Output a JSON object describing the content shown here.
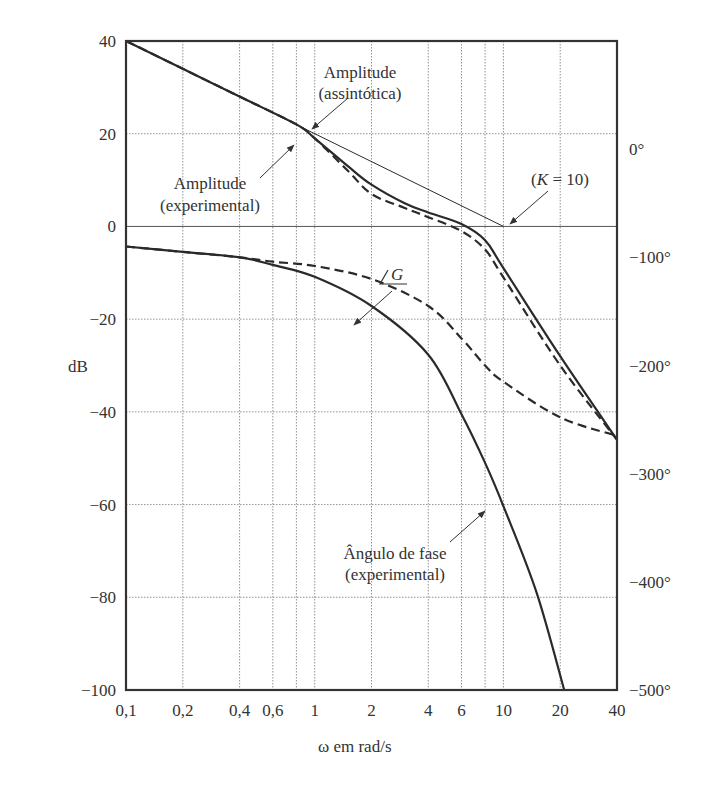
{
  "chart_data": {
    "type": "line",
    "title": "",
    "xlabel": "ω em rad/s",
    "ylabel": "dB",
    "ylabel_right": "phase (degrees)",
    "xscale": "log",
    "xlim": [
      0.1,
      40
    ],
    "ylim": [
      -100,
      40
    ],
    "ylim_right": [
      -500,
      100
    ],
    "grid": true,
    "x_ticks": [
      0.1,
      0.2,
      0.4,
      0.6,
      0.8,
      1,
      2,
      4,
      6,
      8,
      10,
      20,
      40
    ],
    "x_tick_labels": [
      "0,1",
      "0,2",
      "0,4",
      "0,6",
      "",
      "1",
      "2",
      "4",
      "6",
      "",
      "10",
      "20",
      "40"
    ],
    "y_ticks": [
      40,
      20,
      0,
      -20,
      -40,
      -60,
      -80,
      -100
    ],
    "y_tick_labels": [
      "40",
      "20",
      "0",
      "−20",
      "−40",
      "−60",
      "−80",
      "−100"
    ],
    "y_right_ticks": [
      0,
      -100,
      -200,
      -300,
      -400,
      -500
    ],
    "y_right_tick_labels": [
      "0°",
      "−100°",
      "−200°",
      "−300°",
      "−400°",
      "−500°"
    ],
    "series": [
      {
        "name": "Amplitude (assintótica)",
        "axis": "left",
        "style": "thin-solid",
        "x": [
          0.1,
          10
        ],
        "y": [
          40,
          0
        ]
      },
      {
        "name": "Amplitude (experimental)",
        "axis": "left",
        "style": "solid",
        "x": [
          0.1,
          0.2,
          0.4,
          0.8,
          1,
          1.5,
          2,
          3,
          4,
          6,
          8,
          10,
          20,
          40
        ],
        "y": [
          40,
          34,
          28,
          22,
          19,
          13,
          9,
          5,
          3,
          0.5,
          -3,
          -9,
          -28,
          -46
        ]
      },
      {
        "name": "Amplitude (dashed)",
        "axis": "left",
        "style": "dashed",
        "x": [
          0.1,
          0.2,
          0.4,
          0.8,
          1,
          1.5,
          2,
          3,
          4,
          6,
          8,
          10,
          20,
          40
        ],
        "y": [
          40,
          34,
          28,
          22,
          19,
          12,
          7,
          4,
          2,
          -1,
          -5,
          -11,
          -30,
          -46
        ]
      },
      {
        "name": "Ângulo de fase (experimental)",
        "axis": "right",
        "style": "solid",
        "x": [
          0.1,
          0.2,
          0.4,
          0.6,
          1,
          2,
          4,
          6,
          8,
          10,
          15,
          21
        ],
        "y": [
          -90,
          -95,
          -100,
          -107,
          -118,
          -145,
          -190,
          -245,
          -290,
          -330,
          -410,
          -500
        ]
      },
      {
        "name": "∠G",
        "axis": "right",
        "style": "dashed",
        "x": [
          0.1,
          0.2,
          0.4,
          0.6,
          1,
          2,
          4,
          6,
          8,
          10,
          20,
          40
        ],
        "y": [
          -90,
          -95,
          -100,
          -104,
          -108,
          -120,
          -145,
          -175,
          -200,
          -215,
          -248,
          -265
        ]
      }
    ],
    "annotations": [
      {
        "text": "Amplitude",
        "line2": "(assintótica)"
      },
      {
        "text": "Amplitude",
        "line2": "(experimental)"
      },
      {
        "text": "(K = 10)"
      },
      {
        "text": "∠G"
      },
      {
        "text": "Ângulo de fase",
        "line2": "(experimental)"
      }
    ]
  },
  "labels": {
    "ylabel": "dB",
    "xlabel": "ω em rad/s",
    "amp_asym_1": "Amplitude",
    "amp_asym_2": "(assintótica)",
    "amp_exp_1": "Amplitude",
    "amp_exp_2": "(experimental)",
    "k_label_open": "(",
    "k_label_k": "K",
    "k_label_rest": " = 10)",
    "angle_g": "G",
    "phase_1": "Ângulo de fase",
    "phase_2": "(experimental)"
  }
}
